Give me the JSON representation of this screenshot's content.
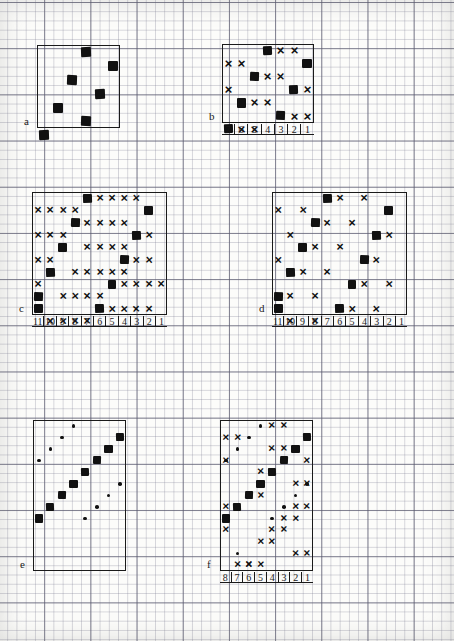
{
  "document": {
    "title": "Hand-drawn grid diagrams on graph paper",
    "kind": "six-panel figure",
    "background": "graph-paper",
    "ink_color": "#111111",
    "paper_color": "#fcfcfa",
    "grid_minor_color": "#82829633",
    "grid_major_color": "#5a5a6eb8"
  },
  "marks": {
    "square_label": "filled-square",
    "x_label": "x-mark",
    "x_glyph": "×",
    "dot_label": "dot"
  },
  "panels": [
    {
      "id": "a",
      "letter": "a",
      "cols": 6,
      "rows": 6,
      "left": 37,
      "top": 45,
      "cell": 13.9,
      "has_axis_labels": false,
      "axis_labels": [],
      "squares": [
        [
          3,
          0
        ],
        [
          5,
          1
        ],
        [
          2,
          2
        ],
        [
          4,
          3
        ],
        [
          1,
          4
        ],
        [
          3,
          5
        ],
        [
          0,
          6
        ]
      ],
      "xs": [],
      "dots": []
    },
    {
      "id": "b",
      "letter": "b",
      "cols": 7,
      "rows": 6,
      "left": 222,
      "top": 44,
      "cell": 13.1,
      "has_axis_labels": true,
      "axis_labels": [
        "7",
        "6",
        "5",
        "4",
        "3",
        "2",
        "1"
      ],
      "squares": [
        [
          3,
          0
        ],
        [
          6,
          1
        ],
        [
          2,
          2
        ],
        [
          5,
          3
        ],
        [
          1,
          4
        ],
        [
          4,
          5
        ],
        [
          0,
          6
        ]
      ],
      "xs": [
        [
          4,
          0
        ],
        [
          5,
          0
        ],
        [
          0,
          1
        ],
        [
          1,
          1
        ],
        [
          3,
          2
        ],
        [
          4,
          2
        ],
        [
          0,
          3
        ],
        [
          6,
          3
        ],
        [
          2,
          4
        ],
        [
          3,
          4
        ],
        [
          5,
          5
        ],
        [
          6,
          5
        ],
        [
          1,
          6
        ],
        [
          2,
          6
        ]
      ],
      "dots": []
    },
    {
      "id": "c",
      "letter": "c",
      "cols": 11,
      "rows": 10,
      "left": 32,
      "top": 192,
      "cell": 12.3,
      "has_axis_labels": true,
      "axis_labels": [
        "11",
        "10",
        "9",
        "8",
        "7",
        "6",
        "5",
        "4",
        "3",
        "2",
        "1"
      ],
      "squares": [
        [
          4,
          0
        ],
        [
          9,
          1
        ],
        [
          3,
          2
        ],
        [
          8,
          3
        ],
        [
          2,
          4
        ],
        [
          7,
          5
        ],
        [
          1,
          6
        ],
        [
          6,
          7
        ],
        [
          0,
          8
        ],
        [
          5,
          9
        ],
        [
          0,
          9
        ]
      ],
      "xs": [
        [
          5,
          0
        ],
        [
          6,
          0
        ],
        [
          7,
          0
        ],
        [
          8,
          0
        ],
        [
          0,
          1
        ],
        [
          1,
          1
        ],
        [
          2,
          1
        ],
        [
          3,
          1
        ],
        [
          4,
          2
        ],
        [
          5,
          2
        ],
        [
          6,
          2
        ],
        [
          7,
          2
        ],
        [
          0,
          3
        ],
        [
          1,
          3
        ],
        [
          2,
          3
        ],
        [
          9,
          3
        ],
        [
          4,
          4
        ],
        [
          5,
          4
        ],
        [
          6,
          4
        ],
        [
          7,
          4
        ],
        [
          0,
          5
        ],
        [
          1,
          5
        ],
        [
          8,
          5
        ],
        [
          9,
          5
        ],
        [
          3,
          6
        ],
        [
          4,
          6
        ],
        [
          5,
          6
        ],
        [
          6,
          6
        ],
        [
          7,
          6
        ],
        [
          0,
          7
        ],
        [
          7,
          7
        ],
        [
          8,
          7
        ],
        [
          9,
          7
        ],
        [
          10,
          7
        ],
        [
          2,
          8
        ],
        [
          3,
          8
        ],
        [
          4,
          8
        ],
        [
          5,
          8
        ],
        [
          6,
          9
        ],
        [
          7,
          9
        ],
        [
          8,
          9
        ],
        [
          9,
          9
        ],
        [
          1,
          10
        ],
        [
          2,
          10
        ],
        [
          3,
          10
        ],
        [
          4,
          10
        ]
      ],
      "dots": []
    },
    {
      "id": "d",
      "letter": "d",
      "cols": 11,
      "rows": 10,
      "left": 272,
      "top": 192,
      "cell": 12.3,
      "has_axis_labels": true,
      "axis_labels": [
        "11",
        "10",
        "9",
        "8",
        "7",
        "6",
        "5",
        "4",
        "3",
        "2",
        "1"
      ],
      "squares": [
        [
          4,
          0
        ],
        [
          9,
          1
        ],
        [
          3,
          2
        ],
        [
          8,
          3
        ],
        [
          2,
          4
        ],
        [
          7,
          5
        ],
        [
          1,
          6
        ],
        [
          6,
          7
        ],
        [
          0,
          8
        ],
        [
          5,
          9
        ],
        [
          0,
          9
        ]
      ],
      "xs": [
        [
          5,
          0
        ],
        [
          7,
          0
        ],
        [
          0,
          1
        ],
        [
          2,
          1
        ],
        [
          4,
          2
        ],
        [
          6,
          2
        ],
        [
          1,
          3
        ],
        [
          9,
          3
        ],
        [
          3,
          4
        ],
        [
          5,
          4
        ],
        [
          0,
          5
        ],
        [
          8,
          5
        ],
        [
          2,
          6
        ],
        [
          4,
          6
        ],
        [
          7,
          7
        ],
        [
          9,
          7
        ],
        [
          1,
          8
        ],
        [
          3,
          8
        ],
        [
          6,
          9
        ],
        [
          8,
          9
        ],
        [
          1,
          10
        ],
        [
          3,
          10
        ]
      ],
      "dots": []
    },
    {
      "id": "e",
      "letter": "e",
      "cols": 8,
      "rows": 13,
      "left": 33,
      "top": 420,
      "cell": 11.6,
      "has_axis_labels": false,
      "axis_labels": [],
      "squares": [
        [
          7,
          1
        ],
        [
          6,
          2
        ],
        [
          5,
          3
        ],
        [
          4,
          4
        ],
        [
          3,
          5
        ],
        [
          2,
          6
        ],
        [
          1,
          7
        ],
        [
          0,
          8
        ]
      ],
      "xs": [],
      "dots": [
        [
          3,
          0
        ],
        [
          2,
          1
        ],
        [
          1,
          2
        ],
        [
          0,
          3
        ],
        [
          7,
          5
        ],
        [
          6,
          6
        ],
        [
          5,
          7
        ],
        [
          4,
          8
        ]
      ]
    },
    {
      "id": "f",
      "letter": "f",
      "cols": 8,
      "rows": 13,
      "left": 220,
      "top": 420,
      "cell": 11.6,
      "has_axis_labels": true,
      "axis_labels": [
        "8",
        "7",
        "6",
        "5",
        "4",
        "3",
        "2",
        "1"
      ],
      "squares": [
        [
          7,
          1
        ],
        [
          6,
          2
        ],
        [
          5,
          3
        ],
        [
          4,
          4
        ],
        [
          3,
          5
        ],
        [
          2,
          6
        ],
        [
          1,
          7
        ],
        [
          0,
          8
        ]
      ],
      "xs": [
        [
          4,
          0
        ],
        [
          5,
          0
        ],
        [
          0,
          1
        ],
        [
          1,
          1
        ],
        [
          4,
          2
        ],
        [
          5,
          2
        ],
        [
          0,
          3
        ],
        [
          7,
          3
        ],
        [
          3,
          4
        ],
        [
          4,
          4
        ],
        [
          6,
          5
        ],
        [
          7,
          5
        ],
        [
          2,
          6
        ],
        [
          3,
          6
        ],
        [
          0,
          7
        ],
        [
          6,
          7
        ],
        [
          7,
          7
        ],
        [
          5,
          8
        ],
        [
          6,
          8
        ],
        [
          0,
          9
        ],
        [
          4,
          9
        ],
        [
          5,
          9
        ],
        [
          3,
          10
        ],
        [
          4,
          10
        ],
        [
          6,
          11
        ],
        [
          7,
          11
        ],
        [
          2,
          12
        ],
        [
          3,
          12
        ],
        [
          1,
          12
        ],
        [
          2,
          12
        ]
      ],
      "dots": [
        [
          3,
          0
        ],
        [
          2,
          1
        ],
        [
          1,
          2
        ],
        [
          0,
          3
        ],
        [
          7,
          5
        ],
        [
          6,
          6
        ],
        [
          5,
          7
        ],
        [
          4,
          8
        ],
        [
          1,
          11
        ]
      ]
    }
  ]
}
